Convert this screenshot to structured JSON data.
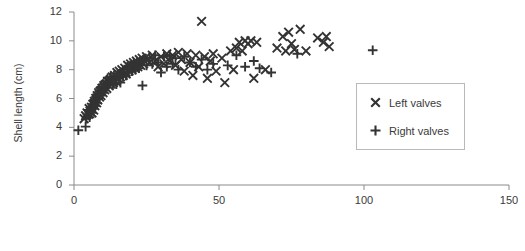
{
  "chart_data": {
    "type": "scatter",
    "title": "",
    "xlabel": "",
    "ylabel": "Shell length (cm)",
    "xlim": [
      0,
      150
    ],
    "ylim": [
      0,
      12
    ],
    "xticks": [
      0,
      50,
      100,
      150
    ],
    "yticks": [
      0,
      2,
      4,
      6,
      8,
      10,
      12
    ],
    "grid": false,
    "legend_position": "center-right",
    "series": [
      {
        "name": "Left valves",
        "marker": "x",
        "color": "#333333",
        "points": [
          [
            3.5,
            4.6
          ],
          [
            4.0,
            4.8
          ],
          [
            4.5,
            5.0
          ],
          [
            5.0,
            4.9
          ],
          [
            5.2,
            5.3
          ],
          [
            5.5,
            5.1
          ],
          [
            6.0,
            5.4
          ],
          [
            6.2,
            5.0
          ],
          [
            6.5,
            5.6
          ],
          [
            6.8,
            5.2
          ],
          [
            7.0,
            5.8
          ],
          [
            7.2,
            5.5
          ],
          [
            7.5,
            6.0
          ],
          [
            7.8,
            5.7
          ],
          [
            8.0,
            6.2
          ],
          [
            8.2,
            5.9
          ],
          [
            8.5,
            6.4
          ],
          [
            8.8,
            6.1
          ],
          [
            9.0,
            6.5
          ],
          [
            9.3,
            6.2
          ],
          [
            9.6,
            6.7
          ],
          [
            10.0,
            6.4
          ],
          [
            10.3,
            6.9
          ],
          [
            10.6,
            6.6
          ],
          [
            11.0,
            7.0
          ],
          [
            11.3,
            6.7
          ],
          [
            11.6,
            7.2
          ],
          [
            12.0,
            6.9
          ],
          [
            12.4,
            7.3
          ],
          [
            12.8,
            7.0
          ],
          [
            13.2,
            7.5
          ],
          [
            13.6,
            7.1
          ],
          [
            14.0,
            7.6
          ],
          [
            14.4,
            7.2
          ],
          [
            14.8,
            7.8
          ],
          [
            15.2,
            7.4
          ],
          [
            15.6,
            7.9
          ],
          [
            16.0,
            7.5
          ],
          [
            16.5,
            8.0
          ],
          [
            17.0,
            7.6
          ],
          [
            17.5,
            8.1
          ],
          [
            18.0,
            7.7
          ],
          [
            18.5,
            8.3
          ],
          [
            19.0,
            7.9
          ],
          [
            19.5,
            8.4
          ],
          [
            20.0,
            8.0
          ],
          [
            20.5,
            8.5
          ],
          [
            21.0,
            8.1
          ],
          [
            21.5,
            8.6
          ],
          [
            22.0,
            8.2
          ],
          [
            22.5,
            8.7
          ],
          [
            23.0,
            8.3
          ],
          [
            23.5,
            8.8
          ],
          [
            24.0,
            8.4
          ],
          [
            25.0,
            8.9
          ],
          [
            26.0,
            8.5
          ],
          [
            27.0,
            9.0
          ],
          [
            28.0,
            8.6
          ],
          [
            29.0,
            8.2
          ],
          [
            30.0,
            8.9
          ],
          [
            31.0,
            8.4
          ],
          [
            32.0,
            9.1
          ],
          [
            33.0,
            8.6
          ],
          [
            34.0,
            9.0
          ],
          [
            35.0,
            8.3
          ],
          [
            36.0,
            9.2
          ],
          [
            37.0,
            8.7
          ],
          [
            38.0,
            7.9
          ],
          [
            39.0,
            9.1
          ],
          [
            40.0,
            8.5
          ],
          [
            41.0,
            7.6
          ],
          [
            42.0,
            9.0
          ],
          [
            43.0,
            8.2
          ],
          [
            44.0,
            11.35
          ],
          [
            45.0,
            8.9
          ],
          [
            46.0,
            7.4
          ],
          [
            47.0,
            8.6
          ],
          [
            48.0,
            9.1
          ],
          [
            49.0,
            7.9
          ],
          [
            51.0,
            8.8
          ],
          [
            52.0,
            7.1
          ],
          [
            54.0,
            9.3
          ],
          [
            55.0,
            8.0
          ],
          [
            56.0,
            9.5
          ],
          [
            57.0,
            9.9
          ],
          [
            58.0,
            9.3
          ],
          [
            59.0,
            10.0
          ],
          [
            60.0,
            9.8
          ],
          [
            61.0,
            10.0
          ],
          [
            62.0,
            7.4
          ],
          [
            63.0,
            9.9
          ],
          [
            66.0,
            8.0
          ],
          [
            70.0,
            9.5
          ],
          [
            72.0,
            10.3
          ],
          [
            73.0,
            9.3
          ],
          [
            74.0,
            10.6
          ],
          [
            75.0,
            9.8
          ],
          [
            76.0,
            9.4
          ],
          [
            78.0,
            10.8
          ],
          [
            80.0,
            9.3
          ],
          [
            84.0,
            10.2
          ],
          [
            86.0,
            9.9
          ],
          [
            87.0,
            10.3
          ],
          [
            88.0,
            9.6
          ]
        ]
      },
      {
        "name": "Right valves",
        "marker": "+",
        "color": "#333333",
        "points": [
          [
            1.5,
            3.8
          ],
          [
            4.0,
            4.05
          ],
          [
            4.2,
            4.6
          ],
          [
            4.6,
            4.9
          ],
          [
            5.0,
            5.2
          ],
          [
            5.4,
            4.7
          ],
          [
            5.8,
            5.4
          ],
          [
            6.1,
            5.0
          ],
          [
            6.4,
            5.6
          ],
          [
            6.7,
            5.3
          ],
          [
            7.0,
            5.9
          ],
          [
            7.3,
            5.5
          ],
          [
            7.6,
            6.1
          ],
          [
            7.9,
            5.7
          ],
          [
            8.1,
            6.3
          ],
          [
            8.4,
            6.0
          ],
          [
            8.7,
            6.5
          ],
          [
            9.0,
            6.2
          ],
          [
            9.4,
            6.8
          ],
          [
            9.8,
            6.4
          ],
          [
            10.1,
            7.0
          ],
          [
            10.5,
            6.6
          ],
          [
            10.9,
            7.2
          ],
          [
            11.2,
            6.8
          ],
          [
            11.6,
            7.4
          ],
          [
            12.0,
            7.0
          ],
          [
            12.3,
            7.1
          ],
          [
            12.7,
            7.5
          ],
          [
            13.0,
            7.2
          ],
          [
            13.4,
            6.9
          ],
          [
            13.8,
            7.6
          ],
          [
            14.2,
            7.3
          ],
          [
            14.6,
            7.0
          ],
          [
            15.0,
            7.7
          ],
          [
            15.5,
            7.4
          ],
          [
            16.0,
            7.1
          ],
          [
            16.4,
            7.8
          ],
          [
            16.9,
            7.5
          ],
          [
            17.4,
            8.0
          ],
          [
            17.9,
            7.6
          ],
          [
            18.4,
            8.2
          ],
          [
            18.9,
            7.8
          ],
          [
            19.4,
            8.3
          ],
          [
            20.0,
            7.9
          ],
          [
            20.6,
            8.4
          ],
          [
            21.2,
            8.0
          ],
          [
            21.8,
            8.5
          ],
          [
            22.4,
            8.1
          ],
          [
            23.0,
            8.6
          ],
          [
            23.6,
            6.9
          ],
          [
            24.2,
            8.7
          ],
          [
            25.0,
            8.3
          ],
          [
            26.0,
            8.8
          ],
          [
            27.0,
            8.4
          ],
          [
            28.0,
            9.0
          ],
          [
            29.0,
            8.5
          ],
          [
            30.0,
            7.8
          ],
          [
            31.0,
            8.9
          ],
          [
            32.0,
            8.2
          ],
          [
            33.0,
            9.0
          ],
          [
            34.0,
            8.4
          ],
          [
            35.0,
            8.8
          ],
          [
            36.0,
            8.0
          ],
          [
            38.0,
            8.9
          ],
          [
            40.0,
            8.5
          ],
          [
            42.0,
            8.2
          ],
          [
            44.0,
            8.7
          ],
          [
            46.0,
            8.0
          ],
          [
            48.0,
            8.4
          ],
          [
            53.0,
            8.3
          ],
          [
            56.0,
            9.0
          ],
          [
            59.0,
            8.2
          ],
          [
            62.0,
            8.6
          ],
          [
            64.0,
            8.1
          ],
          [
            68.0,
            7.8
          ],
          [
            77.0,
            9.1
          ],
          [
            103.0,
            9.35
          ]
        ]
      }
    ]
  },
  "legend": {
    "items": [
      {
        "label": "Left valves",
        "marker": "x"
      },
      {
        "label": "Right valves",
        "marker": "plus"
      }
    ]
  },
  "axis": {
    "y_title": "Shell length (cm)",
    "y_tick_labels": [
      "0",
      "2",
      "4",
      "6",
      "8",
      "10",
      "12"
    ],
    "x_tick_labels": [
      "0",
      "50",
      "100",
      "150"
    ]
  },
  "colors": {
    "marker": "#333333",
    "axis": "#8a8a8a",
    "text": "#3a3a3a",
    "legend_border": "#b9b9b9"
  }
}
